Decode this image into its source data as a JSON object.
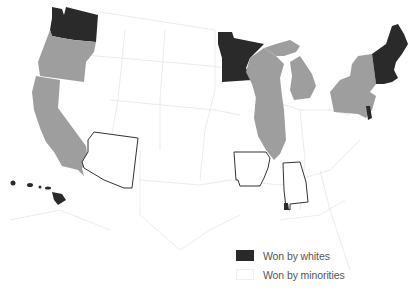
{
  "map": {
    "type": "choropleth",
    "region": "United States",
    "colors": {
      "won_by_whites": "#2a2a2a",
      "won_by_minorities": "#ffffff",
      "highlighted_gray": "#9e9e9e",
      "outline": "#333333",
      "background_borders": "#e6e6e6"
    },
    "states_dark": [
      "Washington",
      "Minnesota",
      "Maine",
      "New Hampshire",
      "Vermont",
      "Massachusetts",
      "Delaware",
      "Hawaii"
    ],
    "states_gray": [
      "Oregon",
      "California",
      "Wisconsin",
      "Illinois",
      "Michigan",
      "New York",
      "Pennsylvania",
      "New Jersey"
    ],
    "states_outlined": [
      "Arizona",
      "Arkansas",
      "Alabama"
    ]
  },
  "legend": {
    "items": [
      {
        "label": "Won by whites",
        "color": "#2a2a2a"
      },
      {
        "label": "Won by minorities",
        "color": "#ffffff"
      }
    ]
  }
}
